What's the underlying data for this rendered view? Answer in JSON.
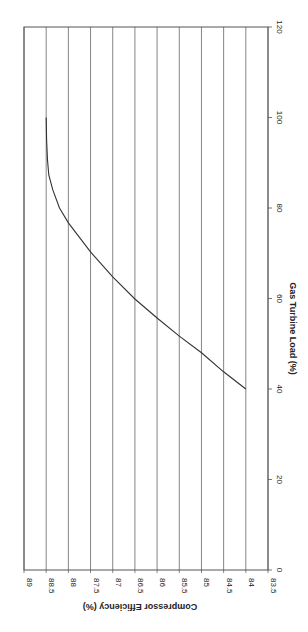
{
  "chart_data": {
    "type": "line",
    "title": "",
    "xlabel": "Gas Turbine Load (%)",
    "ylabel": "Compressor Efficiency (%)",
    "xlim": [
      0,
      120
    ],
    "ylim": [
      83.5,
      89
    ],
    "x_ticks": [
      0,
      20,
      40,
      60,
      80,
      100,
      120
    ],
    "y_ticks": [
      83.5,
      84,
      84.5,
      85,
      85.5,
      86,
      86.5,
      87,
      87.5,
      88,
      88.5,
      89
    ],
    "grid": "horizontal",
    "legend": "none",
    "orientation": "rotated 90 degrees clockwise (x-axis on right, reading bottom-to-top)",
    "series": [
      {
        "name": "Compressor Efficiency",
        "color": "#333333",
        "x": [
          40,
          43.8,
          48,
          51.7,
          55.7,
          59.9,
          64.8,
          70.3,
          76.7,
          80,
          84,
          87.3,
          90.6,
          95,
          100
        ],
        "y": [
          84.0,
          84.5,
          85.0,
          85.5,
          86.0,
          86.5,
          87.0,
          87.5,
          88.0,
          88.2,
          88.35,
          88.44,
          88.47,
          88.49,
          88.5
        ]
      }
    ]
  },
  "labels": {
    "xlabel": "Gas Turbine Load (%)",
    "ylabel": "Compressor Efficiency (%)"
  }
}
